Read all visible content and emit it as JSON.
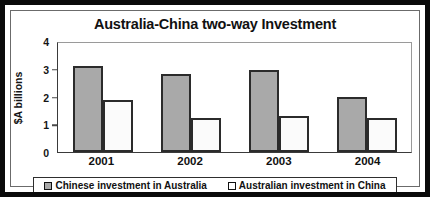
{
  "chart_data": {
    "type": "bar",
    "title": "Australia-China two-way Investment",
    "xlabel": "",
    "ylabel": "$A billions",
    "categories": [
      "2001",
      "2002",
      "2003",
      "2004"
    ],
    "series": [
      {
        "name": "Chinese investment in Australia",
        "color": "#a9a9a9",
        "values": [
          3.15,
          2.85,
          3.0,
          2.0
        ]
      },
      {
        "name": "Australian investment in China",
        "color": "#ffffff",
        "values": [
          1.9,
          1.25,
          1.3,
          1.25
        ]
      }
    ],
    "ylim": [
      0,
      4
    ],
    "yticks": [
      0,
      1,
      2,
      3,
      4
    ],
    "ytick_labels": [
      "0",
      "1",
      "2",
      "3",
      "4"
    ],
    "grid": false,
    "legend_position": "bottom"
  },
  "legend": {
    "items": [
      {
        "label": "Chinese investment in Australia",
        "swatch": "filled-gray-square"
      },
      {
        "label": "Australian investment in China",
        "swatch": "hollow-white-square"
      }
    ]
  },
  "colors": {
    "series_1": "#a9a9a9",
    "series_2": "#ffffff",
    "bar_outline": "#2b2b2b",
    "frame": "#0a0a0a",
    "text": "#111111"
  }
}
